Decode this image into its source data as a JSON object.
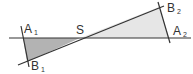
{
  "figure": {
    "colors": {
      "line": "#333333",
      "left_triangle_fill": "#b3b3b3",
      "right_triangle_fill": "#e6e6e6",
      "background": "#ffffff"
    },
    "points": {
      "A1": {
        "label": "A",
        "sub": "1"
      },
      "B1": {
        "label": "B",
        "sub": "1"
      },
      "S": {
        "label": "S"
      },
      "A2": {
        "label": "A",
        "sub": "2"
      },
      "B2": {
        "label": "B",
        "sub": "2"
      }
    },
    "triangles": [
      {
        "name": "A1-S-B1",
        "shade": "dark"
      },
      {
        "name": "S-B2-A2",
        "shade": "light"
      }
    ]
  }
}
